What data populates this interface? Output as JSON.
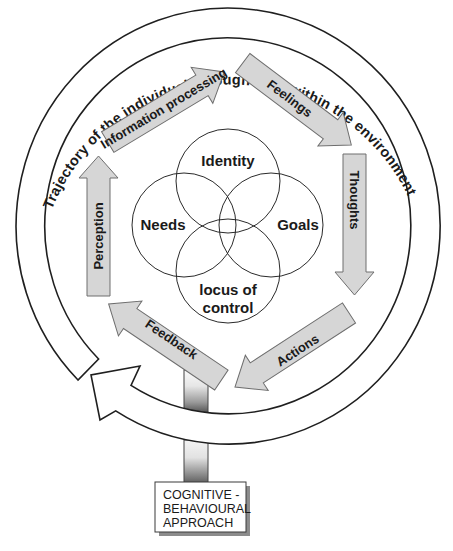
{
  "diagram": {
    "ring_label": "Trajectory of the individual through time within the environment",
    "process_arrows": [
      {
        "id": "information-processing",
        "label": "Information processing"
      },
      {
        "id": "feelings",
        "label": "Feelings"
      },
      {
        "id": "thoughts",
        "label": "Thoughts"
      },
      {
        "id": "actions",
        "label": "Actions"
      },
      {
        "id": "feedback",
        "label": "Feedback"
      },
      {
        "id": "perception",
        "label": "Perception"
      }
    ],
    "venn": [
      {
        "id": "identity",
        "label": "Identity"
      },
      {
        "id": "needs",
        "label": "Needs"
      },
      {
        "id": "goals",
        "label": "Goals"
      },
      {
        "id": "locus",
        "label_line1": "locus of",
        "label_line2": "control"
      }
    ],
    "approach_box": {
      "line1": "COGNITIVE -",
      "line2": "BEHAVIOURAL",
      "line3": "APPROACH"
    },
    "colors": {
      "arrow_fill": "#d6d6d6",
      "arrow_stroke": "#6e6e6e",
      "line": "#1f1f1f",
      "box_shadow": "#8c8c8c"
    }
  }
}
